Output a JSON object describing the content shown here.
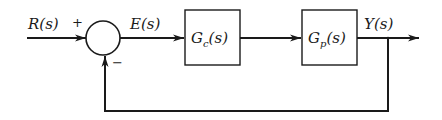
{
  "diagram": {
    "type": "feedback-control-block-diagram",
    "colors": {
      "stroke": "#1a1a1a",
      "background": "#ffffff"
    },
    "signals": {
      "input": "R(s)",
      "error": "E(s)",
      "output": "Y(s)"
    },
    "summing_junction": {
      "plus_sign": "+",
      "minus_sign": "−"
    },
    "blocks": [
      {
        "id": "controller",
        "label_main": "G",
        "label_sub": "c",
        "label_arg": "(s)"
      },
      {
        "id": "plant",
        "label_main": "G",
        "label_sub": "p",
        "label_arg": "(s)"
      }
    ],
    "feedback": "unity negative feedback from Y(s) to summing junction"
  }
}
